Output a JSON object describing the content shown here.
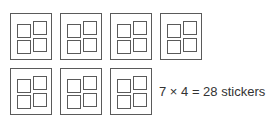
{
  "diagram": {
    "sheets": [
      {
        "row": 1,
        "col": 1,
        "stickers": 4
      },
      {
        "row": 1,
        "col": 2,
        "stickers": 4
      },
      {
        "row": 1,
        "col": 3,
        "stickers": 4
      },
      {
        "row": 1,
        "col": 4,
        "stickers": 4
      },
      {
        "row": 2,
        "col": 1,
        "stickers": 4
      },
      {
        "row": 2,
        "col": 2,
        "stickers": 4
      },
      {
        "row": 2,
        "col": 3,
        "stickers": 4
      }
    ],
    "caption": "7 × 4 = 28 stickers",
    "line_color": "#5a5a5a"
  }
}
